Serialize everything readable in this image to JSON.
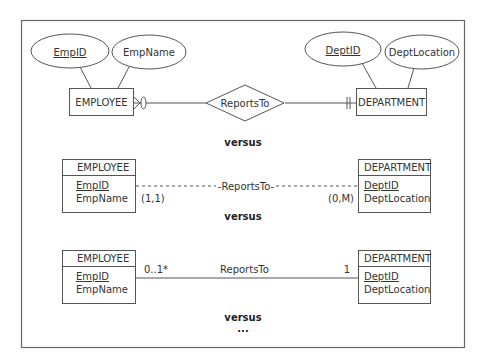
{
  "diagram": {
    "section1": {
      "entity_left": "EMPLOYEE",
      "entity_right": "DEPARTMENT",
      "attr_left_key": "EmpID",
      "attr_left_other": "EmpName",
      "attr_right_key": "DeptID",
      "attr_right_other": "DeptLocation",
      "relationship": "ReportsTo",
      "left_end_notation": "zero-or-many (crow's foot with circle)",
      "right_end_notation": "one-and-only-one (double bar)"
    },
    "separator1": "versus",
    "section2": {
      "entity_left": {
        "title": "EMPLOYEE",
        "key": "EmpID",
        "attr": "EmpName"
      },
      "entity_right": {
        "title": "DEPARTMENT",
        "key": "DeptID",
        "attr": "DeptLocation"
      },
      "relationship": "-ReportsTo-",
      "left_cardinality": "(1,1)",
      "right_cardinality": "(0,M)"
    },
    "separator2": "versus",
    "section3": {
      "entity_left": {
        "title": "EMPLOYEE",
        "key": "EmpID",
        "attr": "EmpName"
      },
      "entity_right": {
        "title": "DEPARTMENT",
        "key": "DeptID",
        "attr": "DeptLocation"
      },
      "relationship": "ReportsTo",
      "left_multiplicity": "0..1*",
      "right_multiplicity": "1"
    },
    "separator3": "versus",
    "ellipsis": "..."
  }
}
